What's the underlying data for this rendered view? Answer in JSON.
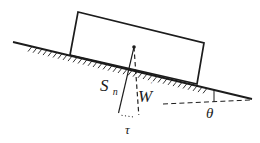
{
  "figure": {
    "type": "physics-free-body-diagram",
    "colors": {
      "ink": "#1c1c1c",
      "background": "#ffffff",
      "faint": "#8f8f8f"
    }
  },
  "labels": {
    "surface_reaction": {
      "symbol": "S",
      "subscript": "n"
    },
    "weight": {
      "symbol": "W",
      "prime_mark": "′"
    },
    "shear_component": {
      "symbol": "τ"
    },
    "incline_angle": {
      "symbol": "θ"
    }
  }
}
